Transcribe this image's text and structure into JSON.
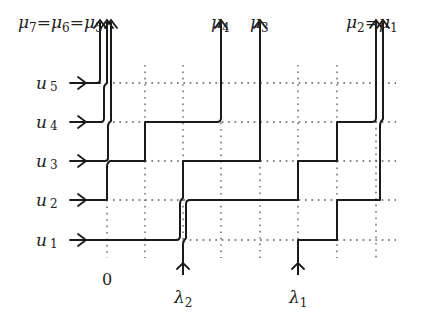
{
  "diagram": {
    "type": "lattice-path-diagram",
    "rows": [
      {
        "label": "u",
        "sub": "1",
        "y": 240
      },
      {
        "label": "u",
        "sub": "2",
        "y": 200
      },
      {
        "label": "u",
        "sub": "3",
        "y": 161
      },
      {
        "label": "u",
        "sub": "4",
        "y": 122
      },
      {
        "label": "u",
        "sub": "5",
        "y": 83
      }
    ],
    "grid_columns_x": [
      107,
      145,
      183,
      221,
      260,
      298,
      337,
      376
    ],
    "origin_label": "0",
    "bottom_labels": [
      {
        "label": "λ",
        "sub": "2",
        "x": 183
      },
      {
        "label": "λ",
        "sub": "1",
        "x": 298
      }
    ],
    "top_labels": [
      {
        "text": "μ",
        "sub": "7",
        "eq": "=",
        "text2": "μ",
        "sub2": "6",
        "eq2": "=",
        "text3": "μ",
        "sub3": "5"
      },
      {
        "text": "μ",
        "sub": "4"
      },
      {
        "text": "μ",
        "sub": "3"
      },
      {
        "text": "μ",
        "sub": "2",
        "eq": "=",
        "text2": "μ",
        "sub2": "1"
      }
    ],
    "colors": {
      "line": "#1a1a1a",
      "grid": "#555555",
      "text": "#222222"
    }
  }
}
